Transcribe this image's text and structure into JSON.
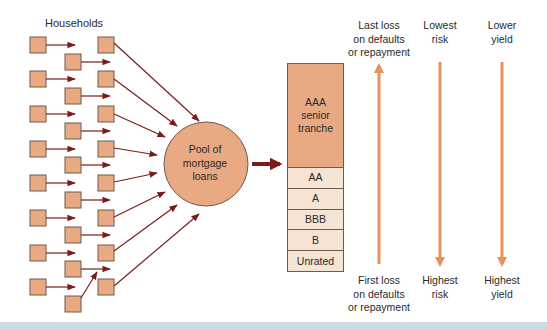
{
  "households": {
    "title": "Households",
    "left_rows_y": [
      37,
      71,
      106,
      141,
      175,
      210,
      245,
      279
    ],
    "middle_rows_y": [
      54,
      88,
      123,
      157,
      192,
      227,
      261,
      296
    ],
    "box_size": 16
  },
  "pool": {
    "label_line1": "Pool of",
    "label_line2": "mortgage",
    "label_line3": "loans"
  },
  "tranches": [
    {
      "name": "AAA senior tranche",
      "line1": "AAA",
      "line2": "senior",
      "line3": "tranche"
    },
    {
      "name": "AA",
      "label": "AA"
    },
    {
      "name": "A",
      "label": "A"
    },
    {
      "name": "BBB",
      "label": "BBB"
    },
    {
      "name": "B",
      "label": "B"
    },
    {
      "name": "Unrated",
      "label": "Unrated"
    }
  ],
  "columns": {
    "loss": {
      "top_line1": "Last loss",
      "top_line2": "on defaults",
      "top_line3": "or repayment",
      "bottom_line1": "First loss",
      "bottom_line2": "on defaults",
      "bottom_line3": "or repayment",
      "arrow_direction": "up"
    },
    "risk": {
      "top_line1": "Lowest",
      "top_line2": "risk",
      "bottom_line1": "Highest",
      "bottom_line2": "risk",
      "arrow_direction": "down"
    },
    "yield": {
      "top_line1": "Lower",
      "top_line2": "yield",
      "bottom_line1": "Highest",
      "bottom_line2": "yield",
      "arrow_direction": "down"
    }
  },
  "colors": {
    "box_fill": "#e9a983",
    "box_border": "#6e5a4e",
    "flow_arrow": "#7a1c1c",
    "scale_arrow": "#e8915c",
    "junior_tranche": "#f5e4d4",
    "bottom_band": "#c9dce4"
  }
}
